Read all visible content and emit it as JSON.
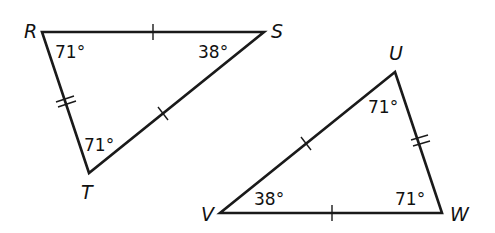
{
  "diagram": {
    "type": "congruent-triangles",
    "line_color": "#1a1a1a",
    "triangles": [
      {
        "name": "RST",
        "vertices": {
          "R": {
            "label": "R",
            "x": 42,
            "y": 32
          },
          "S": {
            "label": "S",
            "x": 264,
            "y": 32
          },
          "T": {
            "label": "T",
            "x": 89,
            "y": 173
          }
        },
        "angles": {
          "R": "71°",
          "S": "38°",
          "T": "71°"
        },
        "side_marks": {
          "RS": 1,
          "ST": 1,
          "RT": 2
        }
      },
      {
        "name": "UVW",
        "vertices": {
          "U": {
            "label": "U",
            "x": 395,
            "y": 72
          },
          "V": {
            "label": "V",
            "x": 220,
            "y": 213
          },
          "W": {
            "label": "W",
            "x": 442,
            "y": 213
          }
        },
        "angles": {
          "U": "71°",
          "V": "38°",
          "W": "71°"
        },
        "side_marks": {
          "UV": 1,
          "VW": 1,
          "UW": 2
        }
      }
    ]
  }
}
